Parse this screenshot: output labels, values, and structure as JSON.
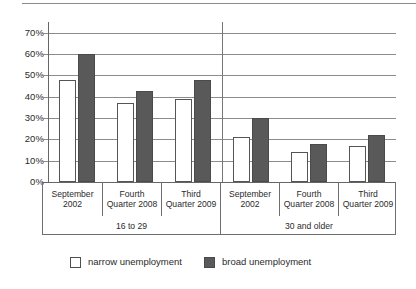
{
  "chart_data": {
    "type": "bar",
    "title": "",
    "subtitle": "",
    "xlabel": "",
    "ylabel": "",
    "ylim": [
      0,
      75
    ],
    "grid": true,
    "legend_position": "bottom-left",
    "y_ticks": [
      "0%",
      "10%",
      "20%",
      "30%",
      "40%",
      "50%",
      "60%",
      "70%"
    ],
    "y_tick_values": [
      0,
      10,
      20,
      30,
      40,
      50,
      60,
      70
    ],
    "categories": [
      "September 2002",
      "Fourth Quarter 2008",
      "Third Quarter 2009",
      "September 2002",
      "Fourth Quarter 2008",
      "Third Quarter 2009"
    ],
    "category_lines": [
      [
        "September",
        "2002"
      ],
      [
        "Fourth",
        "Quarter 2008"
      ],
      [
        "Third",
        "Quarter 2009"
      ],
      [
        "September",
        "2002"
      ],
      [
        "Fourth",
        "Quarter 2008"
      ],
      [
        "Third",
        "Quarter 2009"
      ]
    ],
    "groups": [
      {
        "label": "16 to 29",
        "span": 3
      },
      {
        "label": "30 and older",
        "span": 3
      }
    ],
    "series": [
      {
        "name": "narrow unemployment",
        "color": "#ffffff",
        "values": [
          48,
          37,
          39,
          21,
          14,
          17
        ]
      },
      {
        "name": "broad unemployment",
        "color": "#595959",
        "values": [
          60,
          42.5,
          48,
          30,
          18,
          22
        ]
      }
    ]
  },
  "legend": {
    "items": [
      {
        "label": "narrow unemployment",
        "swatch": "narrow"
      },
      {
        "label": "broad unemployment",
        "swatch": "broad"
      }
    ]
  }
}
